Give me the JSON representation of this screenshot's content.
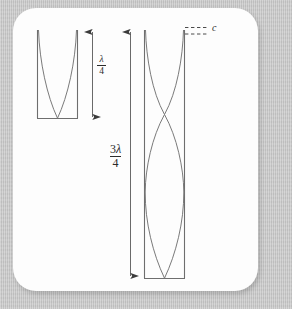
{
  "figure": {
    "background_color": "#c8c8c8",
    "panel_color": "#fdfdfd",
    "line_color": "#6e6e6e",
    "wave_color": "#7a7a7a",
    "text_color": "#2b2b2b"
  },
  "labels": {
    "quarter_wavelength": {
      "numerator": "λ",
      "denominator": "4",
      "full": "λ/4"
    },
    "three_quarter_wavelength": {
      "numerator_coefficient": "3",
      "numerator_symbol": "λ",
      "denominator": "4",
      "full": "3λ/4"
    },
    "speed_of_sound": "c"
  },
  "tubes": [
    {
      "name": "short-tube",
      "mode": "fundamental",
      "wavelength_label": "λ/4",
      "open_end": "top",
      "closed_end": "bottom",
      "nodes": 1,
      "antinodes": 1
    },
    {
      "name": "long-tube",
      "mode": "third-harmonic",
      "wavelength_label": "3λ/4",
      "open_end": "top",
      "closed_end": "bottom",
      "nodes": 2,
      "antinodes": 2
    }
  ],
  "annotations": {
    "dashed_lines": 2,
    "dashed_line_label": "c",
    "arrows": [
      {
        "name": "quarter-arrow",
        "label": "λ/4",
        "double_headed": true
      },
      {
        "name": "three-quarter-arrow",
        "label": "3λ/4",
        "double_headed": true
      }
    ]
  }
}
